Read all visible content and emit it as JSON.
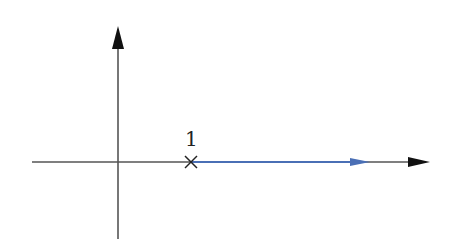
{
  "diagram": {
    "type": "root-locus",
    "axes": {
      "real_axis": {
        "x_start": 32,
        "x_end": 430,
        "y": 162,
        "color": "#555555"
      },
      "imag_axis": {
        "x": 118,
        "y_start": 239,
        "y_end": 28,
        "color": "#555555"
      }
    },
    "pole": {
      "label": "1",
      "marker": "x",
      "x": 191,
      "y": 162
    },
    "locus": {
      "color": "#4a6fb5",
      "from_x": 191,
      "to_x": 370,
      "direction": "right"
    }
  }
}
